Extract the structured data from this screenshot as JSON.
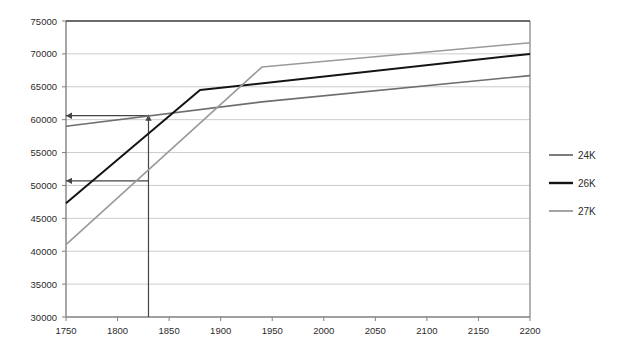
{
  "chart_data": {
    "type": "line",
    "title": "",
    "xlabel": "",
    "ylabel": "",
    "xlim": [
      1750,
      2200
    ],
    "ylim": [
      30000,
      75000
    ],
    "grid": true,
    "legend_position": "right",
    "x_ticks": [
      1750,
      1800,
      1850,
      1900,
      1950,
      2000,
      2050,
      2100,
      2150,
      2200
    ],
    "y_ticks": [
      30000,
      35000,
      40000,
      45000,
      50000,
      55000,
      60000,
      65000,
      70000,
      75000
    ],
    "series": [
      {
        "name": "24K",
        "color": "#6e6e6e",
        "points": [
          {
            "x": 1750,
            "y": 59000
          },
          {
            "x": 1940,
            "y": 62700
          },
          {
            "x": 2200,
            "y": 66700
          }
        ]
      },
      {
        "name": "26K",
        "color": "#141414",
        "points": [
          {
            "x": 1750,
            "y": 47300
          },
          {
            "x": 1880,
            "y": 64500
          },
          {
            "x": 2200,
            "y": 70000
          }
        ]
      },
      {
        "name": "27K",
        "color": "#9a9a9a",
        "points": [
          {
            "x": 1750,
            "y": 41000
          },
          {
            "x": 1940,
            "y": 68000
          },
          {
            "x": 2200,
            "y": 71700
          }
        ]
      }
    ],
    "annotations": [
      {
        "name": "vertical-guide",
        "type": "vline-with-arrow",
        "x": 1830,
        "y_from": 30000,
        "y_to": 60600,
        "color": "#444444"
      },
      {
        "name": "upper-horizontal-arrow",
        "type": "harrow-left",
        "y": 60600,
        "x_from": 1830,
        "x_to": 1750,
        "color": "#444444"
      },
      {
        "name": "lower-horizontal-arrow",
        "type": "harrow-left",
        "y": 50700,
        "x_from": 1830,
        "x_to": 1750,
        "color": "#444444"
      }
    ]
  },
  "legend": {
    "entries": [
      {
        "label": "24K"
      },
      {
        "label": "26K"
      },
      {
        "label": "27K"
      }
    ]
  },
  "axis": {
    "x_tick_labels": [
      "1750",
      "1800",
      "1850",
      "1900",
      "1950",
      "2000",
      "2050",
      "2100",
      "2150",
      "2200"
    ],
    "y_tick_labels": [
      "30000",
      "35000",
      "40000",
      "45000",
      "50000",
      "55000",
      "60000",
      "65000",
      "70000",
      "75000"
    ]
  },
  "colors": {
    "plot_border": "#808080",
    "gridline": "#cccccc",
    "background": "#ffffff",
    "text": "#2b2b2b",
    "annotation": "#444444"
  }
}
